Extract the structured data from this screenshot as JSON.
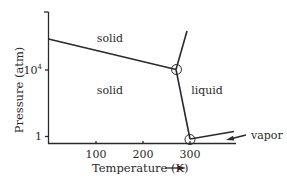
{
  "diagram": {
    "title": "",
    "type": "phase diagram",
    "xlabel": "Temperature (K)",
    "ylabel": "Pressure (atm)",
    "x_ticks": [
      {
        "label": "100",
        "value": 100
      },
      {
        "label": "200",
        "value": 200
      },
      {
        "label": "300",
        "value": 300
      }
    ],
    "y_ticks": [
      {
        "label": "1",
        "value": 1
      },
      {
        "label": "10",
        "sup": "4",
        "value": 10000
      }
    ],
    "regions": [
      {
        "label": "solid",
        "note": "upper solid phase"
      },
      {
        "label": "solid",
        "note": "lower solid phase"
      },
      {
        "label": "liquid"
      },
      {
        "label": "vapor"
      }
    ],
    "triple_points": [
      {
        "description": "solid-solid-liquid",
        "approx_T_K": 270,
        "approx_P_atm": 10000
      },
      {
        "description": "solid-liquid-vapor",
        "approx_T_K": 300,
        "approx_P_atm": 1
      }
    ],
    "colors": {
      "line": "#2a2a2a",
      "background": "#ffffff"
    }
  }
}
